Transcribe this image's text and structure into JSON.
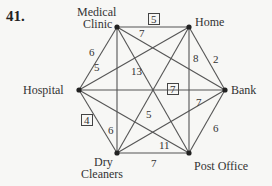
{
  "problem_number": "41.",
  "vertices": [
    {
      "id": "medical_clinic",
      "label_lines": [
        "Medical",
        "Clinic"
      ],
      "x": 117,
      "y": 27
    },
    {
      "id": "home",
      "label_lines": [
        "Home"
      ],
      "x": 189,
      "y": 27
    },
    {
      "id": "hospital",
      "label_lines": [
        "Hospital"
      ],
      "x": 79,
      "y": 90
    },
    {
      "id": "bank",
      "label_lines": [
        "Bank"
      ],
      "x": 225,
      "y": 90
    },
    {
      "id": "dry_cleaners",
      "label_lines": [
        "Dry",
        "Cleaners"
      ],
      "x": 117,
      "y": 153
    },
    {
      "id": "post_office",
      "label_lines": [
        "Post Office"
      ],
      "x": 189,
      "y": 153
    }
  ],
  "edges": [
    {
      "from": "medical_clinic",
      "to": "home",
      "weight": "5",
      "boxed": true
    },
    {
      "from": "medical_clinic",
      "to": "bank",
      "weight": "7",
      "boxed": false
    },
    {
      "from": "medical_clinic",
      "to": "hospital",
      "weight": "6",
      "boxed": false
    },
    {
      "from": "medical_clinic",
      "to": "dry_cleaners",
      "weight": "13",
      "boxed": false
    },
    {
      "from": "medical_clinic",
      "to": "post_office",
      "weight": "",
      "boxed": false
    },
    {
      "from": "home",
      "to": "hospital",
      "weight": "5",
      "boxed": false
    },
    {
      "from": "home",
      "to": "bank",
      "weight": "2",
      "boxed": false
    },
    {
      "from": "home",
      "to": "post_office",
      "weight": "8",
      "boxed": false
    },
    {
      "from": "home",
      "to": "dry_cleaners",
      "weight": "",
      "boxed": false
    },
    {
      "from": "hospital",
      "to": "bank",
      "weight": "7",
      "boxed": true
    },
    {
      "from": "hospital",
      "to": "dry_cleaners",
      "weight": "4",
      "boxed": true
    },
    {
      "from": "hospital",
      "to": "post_office",
      "weight": "11",
      "boxed": false
    },
    {
      "from": "bank",
      "to": "post_office",
      "weight": "6",
      "boxed": false
    },
    {
      "from": "bank",
      "to": "dry_cleaners",
      "weight": "7",
      "boxed": false
    },
    {
      "from": "dry_cleaners",
      "to": "post_office",
      "weight": "7",
      "boxed": false
    }
  ],
  "labels": {
    "medical_1": "Medical",
    "medical_2": "Clinic",
    "home": "Home",
    "hospital": "Hospital",
    "bank": "Bank",
    "dry_1": "Dry",
    "dry_2": "Cleaners",
    "post": "Post Office"
  },
  "weights": {
    "mc_home": "5",
    "mc_bank": "7",
    "mc_hosp": "6",
    "mc_dry": "13",
    "home_hosp": "5",
    "home_bank": "2",
    "home_post": "8",
    "hosp_bank": "7",
    "hosp_dry": "4",
    "hosp_post": "11",
    "bank_post": "6",
    "bank_dry": "7",
    "dry_post": "7",
    "dry_home": "5",
    "dry_mc": "6"
  }
}
